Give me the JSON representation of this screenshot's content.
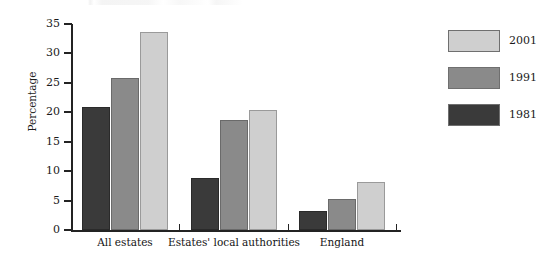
{
  "chart_data": {
    "type": "bar",
    "title": "",
    "xlabel": "",
    "ylabel": "Percentage",
    "ylim": [
      0,
      35
    ],
    "yticks": [
      0,
      5,
      10,
      15,
      20,
      25,
      30,
      35
    ],
    "ytick_labels": [
      "0",
      "5",
      "10",
      "15",
      "20",
      "25",
      "30",
      "35"
    ],
    "grid": false,
    "legend_position": "right",
    "categories": [
      "All estates",
      "Estates' local authorities",
      "England"
    ],
    "series": [
      {
        "name": "1981",
        "color": "#3a3a3a",
        "values": [
          20.9,
          8.8,
          3.2
        ]
      },
      {
        "name": "1991",
        "color": "#8a8a8a",
        "values": [
          25.8,
          18.7,
          5.3
        ]
      },
      {
        "name": "2001",
        "color": "#cfcfcf",
        "values": [
          33.6,
          20.4,
          8.2
        ]
      }
    ],
    "legend_order": [
      "2001",
      "1991",
      "1981"
    ]
  },
  "legend": {
    "entries": [
      {
        "label": "2001",
        "color": "#cfcfcf"
      },
      {
        "label": "1991",
        "color": "#8a8a8a"
      },
      {
        "label": "1981",
        "color": "#3a3a3a"
      }
    ]
  },
  "axes": {
    "y_title": "Percentage",
    "y_ticks": [
      "35",
      "30",
      "25",
      "20",
      "15",
      "10",
      "5",
      "0"
    ],
    "x_categories": [
      "All estates",
      "Estates' local authorities",
      "England"
    ]
  }
}
